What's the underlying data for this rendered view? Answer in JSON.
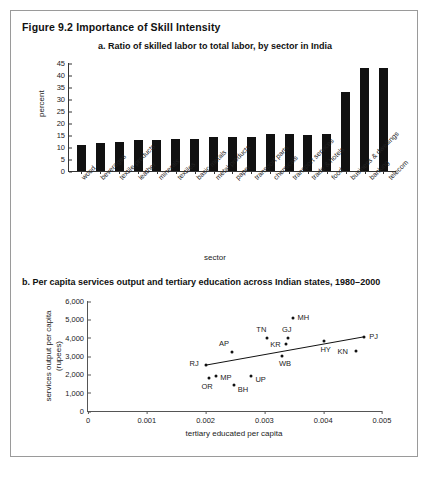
{
  "figure": {
    "title": "Figure 9.2  Importance of Skill Intensity"
  },
  "panel_a": {
    "title": "a. Ratio of skilled labor to total labor, by sector in India"
  },
  "panel_b": {
    "title": "b. Per capita services output and tertiary education across Indian states, 1980–2000"
  },
  "chart_data": [
    {
      "type": "bar",
      "title": "a. Ratio of skilled labor to total labor, by sector in India",
      "xlabel": "sector",
      "ylabel": "percent",
      "ylim": [
        0,
        45
      ],
      "yticks": [
        0,
        5,
        10,
        15,
        20,
        25,
        30,
        35,
        40,
        45
      ],
      "ytick_labels": [
        "0",
        "5",
        "10",
        "15",
        "20",
        "25",
        "30",
        "35",
        "40",
        "45"
      ],
      "grid": false,
      "bar_color": "#111111",
      "categories": [
        "wood",
        "beverages",
        "textile products",
        "leather",
        "minerals",
        "textiles",
        "basic metals",
        "metal products",
        "paper",
        "transport parts",
        "chemicals",
        "transport services",
        "trade & hotels",
        "food",
        "business & dwellings",
        "banking",
        "telecom"
      ],
      "values": [
        10.8,
        11.7,
        11.9,
        12.9,
        13.0,
        13.2,
        13.5,
        14.0,
        14.2,
        14.3,
        15.3,
        15.3,
        14.8,
        15.5,
        33.0,
        43.0,
        43.0
      ]
    },
    {
      "type": "scatter",
      "title": "b. Per capita services output and tertiary education across Indian states, 1980–2000",
      "xlabel": "tertiary educated per capita",
      "ylabel": "services output per capita (rupees)",
      "xlim": [
        0,
        0.005
      ],
      "ylim": [
        0,
        6000
      ],
      "xticks": [
        0,
        0.001,
        0.002,
        0.003,
        0.004,
        0.005
      ],
      "xtick_labels": [
        "0",
        "0.001",
        "0.002",
        "0.003",
        "0.004",
        "0.005"
      ],
      "yticks": [
        0,
        1000,
        2000,
        3000,
        4000,
        5000,
        6000
      ],
      "ytick_labels": [
        "0",
        "1,000",
        "2,000",
        "3,000",
        "4,000",
        "5,000",
        "6,000"
      ],
      "grid": false,
      "point_color": "#111111",
      "marker": "diamond",
      "trendline": {
        "x0": 0.002,
        "y0": 2500,
        "x1": 0.0047,
        "y1": 4050
      },
      "points": [
        {
          "label": "RJ",
          "x": 0.002,
          "y": 2500,
          "label_dx": -16,
          "label_dy": -1
        },
        {
          "label": "OR",
          "x": 0.00205,
          "y": 1800,
          "label_dx": -7,
          "label_dy": 9
        },
        {
          "label": "MP",
          "x": 0.00218,
          "y": 1900,
          "label_dx": 4,
          "label_dy": 2
        },
        {
          "label": "AP",
          "x": 0.00245,
          "y": 3200,
          "label_dx": -13,
          "label_dy": -8
        },
        {
          "label": "BH",
          "x": 0.00248,
          "y": 1400,
          "label_dx": 4,
          "label_dy": 5
        },
        {
          "label": "UP",
          "x": 0.00278,
          "y": 1900,
          "label_dx": 4,
          "label_dy": 4
        },
        {
          "label": "TN",
          "x": 0.00305,
          "y": 4000,
          "label_dx": -11,
          "label_dy": -8
        },
        {
          "label": "WB",
          "x": 0.0033,
          "y": 3000,
          "label_dx": -3,
          "label_dy": 8
        },
        {
          "label": "KR",
          "x": 0.00337,
          "y": 3650,
          "label_dx": -16,
          "label_dy": 1
        },
        {
          "label": "GJ",
          "x": 0.0034,
          "y": 4000,
          "label_dx": -6,
          "label_dy": -8
        },
        {
          "label": "MH",
          "x": 0.00348,
          "y": 5100,
          "label_dx": 5,
          "label_dy": 0
        },
        {
          "label": "HY",
          "x": 0.00402,
          "y": 3800,
          "label_dx": -4,
          "label_dy": 9
        },
        {
          "label": "KN",
          "x": 0.00455,
          "y": 3250,
          "label_dx": -18,
          "label_dy": 1
        },
        {
          "label": "PJ",
          "x": 0.0047,
          "y": 4050,
          "label_dx": 5,
          "label_dy": 0
        }
      ]
    }
  ]
}
